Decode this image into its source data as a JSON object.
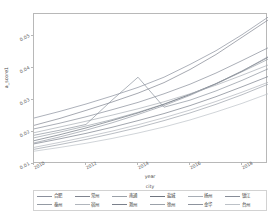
{
  "chart_data": {
    "type": "line",
    "title": "",
    "xlabel": "year",
    "ylabel": "a_score1",
    "xlim": [
      2010,
      2019
    ],
    "ylim": [
      0.01,
      0.057
    ],
    "grid": false,
    "legend_position": "bottom",
    "legend_title": "city",
    "xticks": [
      "2010",
      "2012",
      "2014",
      "2016",
      "2018"
    ],
    "xtick_values": [
      2010,
      2012,
      2014,
      2016,
      2018
    ],
    "yticks": [
      "0.01",
      "0.02",
      "0.03",
      "0.04",
      "0.05"
    ],
    "ytick_values": [
      0.01,
      0.02,
      0.03,
      0.04,
      0.05
    ],
    "x": [
      2010,
      2011,
      2012,
      2013,
      2014,
      2015,
      2016,
      2017,
      2018,
      2019
    ],
    "series": [
      {
        "name": "合肥",
        "color": "#8a8f9c",
        "values": [
          0.0244,
          0.0265,
          0.0288,
          0.0313,
          0.034,
          0.0372,
          0.0412,
          0.0455,
          0.0505,
          0.056
        ]
      },
      {
        "name": "常州",
        "color": "#7f848f",
        "values": [
          0.0221,
          0.0243,
          0.0268,
          0.0294,
          0.0322,
          0.0355,
          0.0396,
          0.0443,
          0.0497,
          0.0551
        ]
      },
      {
        "name": "南通",
        "color": "#9aa0a8",
        "values": [
          0.0182,
          0.02,
          0.0219,
          0.0239,
          0.0262,
          0.0288,
          0.0318,
          0.0351,
          0.0389,
          0.0428
        ]
      },
      {
        "name": "盐城",
        "color": "#6f757f",
        "values": [
          0.0173,
          0.0192,
          0.0213,
          0.0236,
          0.026,
          0.0287,
          0.0318,
          0.0352,
          0.0391,
          0.0434
        ]
      },
      {
        "name": "扬州",
        "color": "#a7adb5",
        "values": [
          0.0198,
          0.0216,
          0.0234,
          0.0253,
          0.0273,
          0.0295,
          0.032,
          0.0347,
          0.0378,
          0.041
        ]
      },
      {
        "name": "镇江",
        "color": "#878d98",
        "values": [
          0.021,
          0.0228,
          0.0248,
          0.027,
          0.0293,
          0.032,
          0.035,
          0.0385,
          0.0424,
          0.0464
        ]
      },
      {
        "name": "泰州",
        "color": "#949aa3",
        "values": [
          0.0166,
          0.0185,
          0.0206,
          0.0229,
          0.0255,
          0.0283,
          0.0315,
          0.0351,
          0.0391,
          0.0436
        ]
      },
      {
        "name": "宿州",
        "color": "#b0b5bc",
        "values": [
          0.0152,
          0.0168,
          0.0185,
          0.0203,
          0.0223,
          0.0245,
          0.0269,
          0.0296,
          0.0325,
          0.0356
        ]
      },
      {
        "name": "滁州",
        "color": "#7a808b",
        "values": [
          0.0163,
          0.0179,
          0.0196,
          0.0215,
          0.0236,
          0.0258,
          0.0283,
          0.0311,
          0.0342,
          0.0374
        ]
      },
      {
        "name": "徐州",
        "color": "#9ba1a9",
        "values": [
          0.0146,
          0.0161,
          0.0177,
          0.0195,
          0.0214,
          0.0236,
          0.026,
          0.0287,
          0.0317,
          0.035
        ]
      },
      {
        "name": "金华",
        "color": "#8d939d",
        "values": [
          0.019,
          0.0206,
          0.0224,
          0.03,
          0.0372,
          0.0278,
          0.03,
          0.0329,
          0.0362,
          0.0398
        ]
      },
      {
        "name": "台州",
        "color": "#bcc1c7",
        "values": [
          0.014,
          0.0152,
          0.0165,
          0.018,
          0.0197,
          0.0216,
          0.0238,
          0.0263,
          0.029,
          0.032
        ]
      }
    ]
  }
}
